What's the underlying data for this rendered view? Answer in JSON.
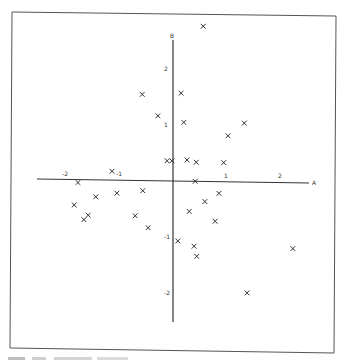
{
  "chart_data": {
    "type": "scatter",
    "title": "",
    "xlabel": "A",
    "ylabel": "B",
    "xlim": [
      -2.6,
      2.6
    ],
    "ylim": [
      -2.2,
      2.8
    ],
    "grid": false,
    "legend": null,
    "marker": "x",
    "x_ticks": [
      -2,
      -1,
      1,
      2
    ],
    "y_ticks": [
      2,
      1,
      -1,
      -2
    ],
    "x_tick_labels": [
      "-2",
      "-1",
      "1",
      "2"
    ],
    "y_tick_labels": [
      "2",
      "1",
      "-1",
      "-2"
    ],
    "series": [
      {
        "name": "points",
        "points": [
          {
            "x": 0.56,
            "y": 2.77
          },
          {
            "x": -0.57,
            "y": 1.54
          },
          {
            "x": 0.15,
            "y": 1.57
          },
          {
            "x": -0.28,
            "y": 1.16
          },
          {
            "x": 0.2,
            "y": 1.05
          },
          {
            "x": 1.32,
            "y": 1.05
          },
          {
            "x": 1.02,
            "y": 0.82
          },
          {
            "x": -0.11,
            "y": 0.36
          },
          {
            "x": -0.02,
            "y": 0.36
          },
          {
            "x": 0.26,
            "y": 0.38
          },
          {
            "x": 0.43,
            "y": 0.34
          },
          {
            "x": 0.94,
            "y": 0.34
          },
          {
            "x": -1.13,
            "y": 0.16
          },
          {
            "x": 0.41,
            "y": 0.0
          },
          {
            "x": -1.76,
            "y": -0.05
          },
          {
            "x": -1.43,
            "y": -0.3
          },
          {
            "x": -1.04,
            "y": -0.23
          },
          {
            "x": -0.56,
            "y": -0.18
          },
          {
            "x": 0.85,
            "y": -0.21
          },
          {
            "x": 0.59,
            "y": -0.36
          },
          {
            "x": -1.83,
            "y": -0.45
          },
          {
            "x": -1.57,
            "y": -0.63
          },
          {
            "x": -1.65,
            "y": -0.71
          },
          {
            "x": -0.7,
            "y": -0.63
          },
          {
            "x": 0.3,
            "y": -0.54
          },
          {
            "x": 0.78,
            "y": -0.71
          },
          {
            "x": -0.46,
            "y": -0.84
          },
          {
            "x": 0.09,
            "y": -1.07
          },
          {
            "x": 0.39,
            "y": -1.16
          },
          {
            "x": 0.44,
            "y": -1.34
          },
          {
            "x": 2.22,
            "y": -1.18
          },
          {
            "x": 1.37,
            "y": -1.98
          }
        ]
      }
    ]
  },
  "caption": ""
}
